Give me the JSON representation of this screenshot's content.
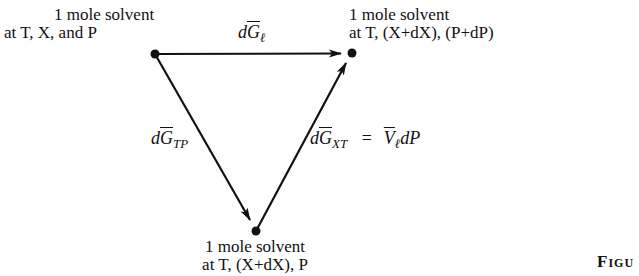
{
  "diagram": {
    "type": "thermodynamic-cycle-triangle",
    "nodes": [
      {
        "id": "top-left",
        "lines": [
          "1 mole solvent",
          "at T, X, and P"
        ],
        "position": [
          155,
          54
        ]
      },
      {
        "id": "top-right",
        "lines": [
          "1 mole solvent",
          "at T, (X+dX), (P+dP)"
        ],
        "position": [
          352,
          53
        ]
      },
      {
        "id": "bottom",
        "lines": [
          "1 mole solvent",
          "at T, (X+dX), P"
        ],
        "position": [
          256,
          231
        ]
      }
    ],
    "edges": [
      {
        "id": "top-edge",
        "from": "top-left",
        "to": "top-right",
        "label_prefix": "d",
        "label_symbol": "G",
        "label_subscript": "ℓ",
        "label_suffix": ""
      },
      {
        "id": "left-edge",
        "from": "top-left",
        "to": "bottom",
        "label_prefix": "d",
        "label_symbol": "G",
        "label_subscript": "TP",
        "label_suffix": ""
      },
      {
        "id": "right-edge",
        "from": "bottom",
        "to": "top-right",
        "label_prefix": "d",
        "label_symbol": "G",
        "label_subscript": "XT",
        "label_equals": "=",
        "label_rhs_symbol": "V",
        "label_rhs_subscript": "ℓ",
        "label_rhs_suffix": "dP"
      }
    ],
    "figure_caption": "Figu"
  }
}
